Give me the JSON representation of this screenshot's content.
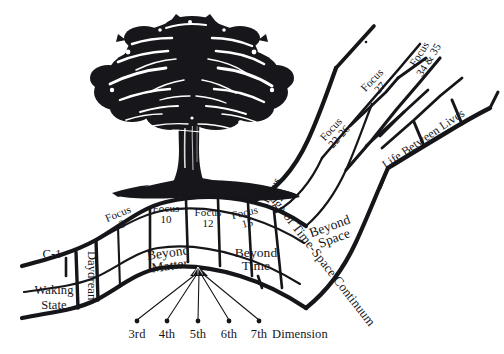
{
  "diagram": {
    "ink_color": "#16161a",
    "background_color": "#ffffff",
    "illustration": {
      "name": "oak-tree-woodcut",
      "label": "tree"
    },
    "bands": [
      {
        "id": "c1",
        "label": "C-1"
      },
      {
        "id": "waking-state",
        "label": "Waking\nState",
        "line1": "Waking",
        "line2": "State"
      },
      {
        "id": "daydream",
        "label": "Daydream",
        "orientation": "vertical"
      }
    ],
    "focus_cells": [
      {
        "id": "focus-3",
        "line1": "Focus",
        "line2": "3",
        "rotate": -22
      },
      {
        "id": "focus-10",
        "line1": "Focus",
        "line2": "10",
        "rotate": 0
      },
      {
        "id": "focus-12",
        "line1": "Focus",
        "line2": "12",
        "rotate": 0
      },
      {
        "id": "focus-15",
        "line1": "Focus",
        "line2": "15",
        "rotate": -14
      },
      {
        "id": "focus-21",
        "line1": "Focus",
        "line2": "21",
        "rotate": -62
      },
      {
        "id": "focus-22-26",
        "line1": "Focus",
        "line2": "22-26",
        "rotate": -48
      },
      {
        "id": "focus-27",
        "line1": "Focus",
        "line2": "27",
        "rotate": -46
      },
      {
        "id": "focus-34-35",
        "line1": "Focus",
        "line2": "34 & 35",
        "rotate": -58
      }
    ],
    "region_cells": [
      {
        "id": "beyond-matter",
        "line1": "Beyond",
        "line2": "Matter",
        "rotate": -8
      },
      {
        "id": "beyond-time",
        "line1": "Beyond",
        "line2": "Time",
        "rotate": 0
      },
      {
        "id": "beyond-space",
        "line1": "Beyond",
        "line2": "Space",
        "rotate": -20
      }
    ],
    "boundary_label": {
      "id": "edge-of-time-space-continuum",
      "text": "Edge of Time-Space Continuum",
      "rotate": 52
    },
    "life_between_lives": {
      "id": "life-between-lives",
      "text": "Life Between Lives",
      "rotate": -34
    },
    "dimension_axis": {
      "suffix": "Dimension",
      "ticks": [
        "3rd",
        "4th",
        "5th",
        "6th",
        "7th"
      ]
    }
  }
}
